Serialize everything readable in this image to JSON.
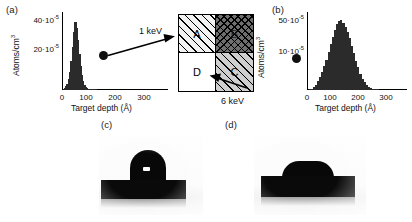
{
  "figure": {
    "panels": {
      "a": {
        "label": "(a)",
        "xlabel": "Target depth (Å)",
        "ylabel": "Atoms/cm",
        "ylabel_exp": "3",
        "xticks": [
          "0",
          "100",
          "200",
          "300"
        ],
        "yticks": [
          "20·10",
          "40·10"
        ],
        "ytick_exp": "-5",
        "energy": "1 keV"
      },
      "b": {
        "label": "(b)",
        "xlabel": "Target depth (Å)",
        "ylabel": "Atoms/cm",
        "ylabel_exp": "3",
        "xticks": [
          "0",
          "100",
          "200",
          "300"
        ],
        "yticks": [
          "10·10",
          "50·10"
        ],
        "ytick_exp": "-5",
        "energy": "6 keV"
      },
      "c": {
        "label": "(c)",
        "caption": ""
      },
      "d": {
        "label": "(d)",
        "caption": ""
      }
    },
    "quadrant_box": {
      "quadrants": [
        {
          "id": "A",
          "label": "A",
          "fill": "diagonal-hatch-light"
        },
        {
          "id": "B",
          "label": "B",
          "fill": "cross-hatch-dark"
        },
        {
          "id": "D",
          "label": "D",
          "fill": "white"
        },
        {
          "id": "C",
          "label": "C",
          "fill": "diagonal-hatch-gray"
        }
      ],
      "in_arrow_label": "1 keV",
      "out_arrow_label": "6 keV"
    },
    "colors": {
      "bar": "#2b2b2b",
      "axis": "#000000",
      "hatch_dark": "#6e6e6e",
      "hatch_gray": "#cfcfcf",
      "substrate": "#0a0a0a"
    }
  },
  "chart_data": [
    {
      "type": "bar",
      "id": "panel-a",
      "title": "(a)",
      "xlabel": "Target depth (Å)",
      "ylabel": "Atoms/cm3",
      "xlim": [
        0,
        330
      ],
      "ylim": [
        0,
        50
      ],
      "yunit": "1e-5",
      "xticks": [
        0,
        100,
        200,
        300
      ],
      "yticks": [
        20,
        40
      ],
      "grid": false,
      "legend": "none",
      "x": [
        2,
        6,
        10,
        14,
        18,
        22,
        26,
        30,
        34,
        38,
        42,
        46,
        50,
        54,
        58,
        62,
        66,
        70,
        74,
        78,
        82,
        86,
        90,
        94,
        98,
        102,
        106,
        110
      ],
      "values": [
        0.5,
        1.2,
        2.4,
        4.0,
        7.0,
        12.0,
        19.0,
        28.0,
        38.0,
        44.5,
        45.0,
        41.0,
        33.0,
        24.0,
        16.0,
        10.0,
        6.0,
        3.5,
        2.0,
        1.2,
        0.7,
        0.4,
        0.25,
        0.15,
        0.1,
        0.06,
        0.03,
        0.0
      ]
    },
    {
      "type": "bar",
      "id": "panel-b",
      "title": "(b)",
      "xlabel": "Target depth (Å)",
      "ylabel": "Atoms/cm3",
      "xlim": [
        0,
        330
      ],
      "ylim": [
        0,
        60
      ],
      "yunit": "1e-5",
      "xticks": [
        0,
        100,
        200,
        300
      ],
      "yticks": [
        10,
        50
      ],
      "grid": false,
      "legend": "none",
      "x": [
        5,
        12,
        19,
        26,
        33,
        40,
        47,
        54,
        61,
        68,
        75,
        82,
        89,
        96,
        103,
        110,
        117,
        124,
        131,
        138,
        145,
        152,
        159,
        166,
        173,
        180,
        187,
        194,
        201,
        208,
        215,
        222,
        229
      ],
      "values": [
        0.4,
        1.0,
        2.2,
        4.0,
        7.0,
        10.5,
        14.0,
        19.0,
        24.0,
        30.0,
        36.0,
        42.0,
        47.0,
        52.0,
        54.5,
        55.0,
        53.0,
        50.0,
        46.0,
        41.0,
        35.0,
        29.0,
        23.0,
        18.0,
        13.0,
        9.0,
        6.0,
        4.0,
        2.4,
        1.4,
        0.8,
        0.4,
        0.1
      ]
    }
  ]
}
